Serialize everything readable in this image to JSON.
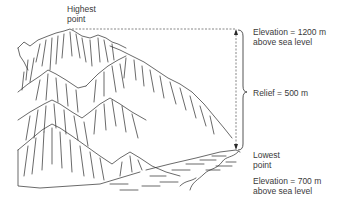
{
  "diagram": {
    "highest_point": {
      "line1": "Highest",
      "line2": "point"
    },
    "top_elevation": {
      "line1": "Elevation = 1200 m",
      "line2": "above sea level"
    },
    "relief": {
      "label": "Relief = 500 m"
    },
    "lowest_point": {
      "line1": "Lowest",
      "line2": "point"
    },
    "bottom_elevation": {
      "line1": "Elevation = 700 m",
      "line2": "above sea level"
    },
    "colors": {
      "ink": "#2a2a2a",
      "text": "#3a3a3a",
      "background": "#ffffff"
    },
    "icons": [
      "mountain-illustration",
      "dashed-reference-line",
      "vertical-arrow",
      "curly-brace"
    ]
  }
}
